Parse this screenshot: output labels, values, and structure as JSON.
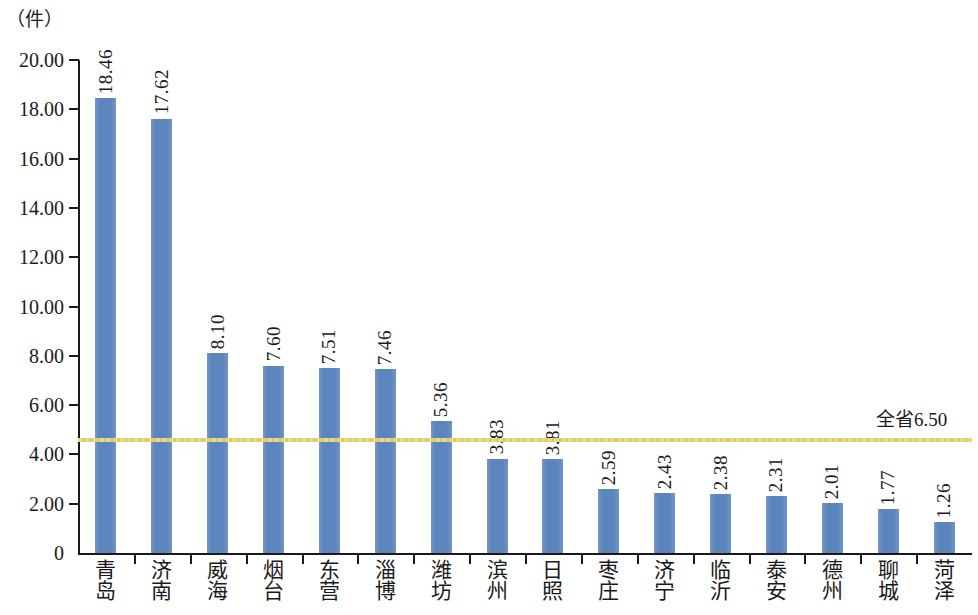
{
  "chart_data": {
    "type": "bar",
    "title": "",
    "subtitle": "",
    "xlabel": "",
    "ylabel": "（件）",
    "unit_label": "（件）",
    "ylim": [
      0,
      20
    ],
    "ytick_labels": [
      "20.00",
      "18.00",
      "16.00",
      "14.00",
      "12.00",
      "10.00",
      "8.00",
      "6.00",
      "4.00",
      "2.00",
      "0"
    ],
    "ytick_values": [
      20,
      18,
      16,
      14,
      12,
      10,
      8,
      6,
      4,
      2,
      0
    ],
    "grid": false,
    "legend": "none",
    "bar_color": "#5c84bd",
    "reference_line_color": "#e6d97f",
    "categories": [
      "青岛",
      "济南",
      "威海",
      "烟台",
      "东营",
      "淄博",
      "潍坊",
      "滨州",
      "日照",
      "枣庄",
      "济宁",
      "临沂",
      "泰安",
      "德州",
      "聊城",
      "菏泽"
    ],
    "values": [
      18.46,
      17.62,
      8.1,
      7.6,
      7.51,
      7.46,
      5.36,
      3.83,
      3.81,
      2.59,
      2.43,
      2.38,
      2.31,
      2.01,
      1.77,
      1.26
    ],
    "value_labels": [
      "18.46",
      "17.62",
      "8.10",
      "7.60",
      "7.51",
      "7.46",
      "5.36",
      "3.83",
      "3.81",
      "2.59",
      "2.43",
      "2.38",
      "2.31",
      "2.01",
      "1.77",
      "1.26"
    ],
    "reference_line": {
      "label": "全省6.50",
      "value": 6.5,
      "drawn_at": 4.6
    }
  }
}
